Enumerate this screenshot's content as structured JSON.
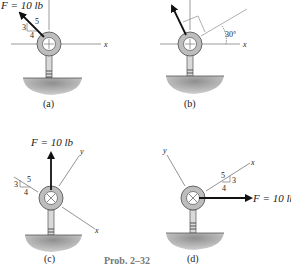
{
  "problem_label": "Prob. 2–32",
  "colors": {
    "axis": "#9a9a9a",
    "force": "#111111",
    "ring_fill": "#bdbdbd",
    "ring_stroke": "#666666",
    "ground": "#9c9c9c",
    "caption": "#222222"
  },
  "panels": [
    {
      "caption": "(a)",
      "force_label": "F = 10 lb",
      "axis_labels": {
        "x": "x"
      },
      "slope": {
        "rise": "3",
        "run": "4",
        "hyp": "5"
      },
      "center_mark": "plus"
    },
    {
      "caption": "(b)",
      "force_label": "F = 10 lb",
      "axis_labels": {
        "x": "x"
      },
      "angle_label": "30°",
      "center_mark": "plus"
    },
    {
      "caption": "(c)",
      "force_label": "F = 10 lb",
      "axis_labels": {
        "x": "x",
        "y": "y"
      },
      "slope": {
        "rise": "3",
        "run": "4",
        "hyp": "5"
      },
      "center_mark": "cross"
    },
    {
      "caption": "(d)",
      "force_label": "F = 10 lb",
      "axis_labels": {
        "x": "x",
        "y": "y"
      },
      "slope": {
        "rise": "3",
        "run": "4",
        "hyp": "5"
      },
      "center_mark": "cross"
    }
  ]
}
